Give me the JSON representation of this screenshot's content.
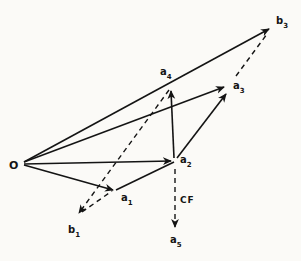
{
  "figure": {
    "background": "#fbfaf7",
    "stroke_color": "#141414",
    "label_color": "#141414",
    "label_font_size": 10,
    "subscript_font_size": 7,
    "nodes": [
      {
        "id": "O",
        "label": "O",
        "sub": "",
        "label_x": 9,
        "label_y": 169,
        "font": 11
      },
      {
        "id": "a1",
        "label": "a",
        "sub": "1",
        "label_x": 121,
        "label_y": 201
      },
      {
        "id": "a2",
        "label": "a",
        "sub": "2",
        "label_x": 180,
        "label_y": 163
      },
      {
        "id": "a3",
        "label": "a",
        "sub": "3",
        "label_x": 233,
        "label_y": 89
      },
      {
        "id": "a4",
        "label": "a",
        "sub": "4",
        "label_x": 160,
        "label_y": 75
      },
      {
        "id": "a5",
        "label": "a",
        "sub": "5",
        "label_x": 170,
        "label_y": 243
      },
      {
        "id": "b1",
        "label": "b",
        "sub": "1",
        "label_x": 68,
        "label_y": 233
      },
      {
        "id": "b3",
        "label": "b",
        "sub": "3",
        "label_x": 276,
        "label_y": 24
      }
    ],
    "edges": [
      {
        "id": "O-a1",
        "x1": 24,
        "y1": 165,
        "x2": 113,
        "y2": 190,
        "style": "solid",
        "arrow": true
      },
      {
        "id": "O-a2",
        "x1": 24,
        "y1": 164,
        "x2": 171,
        "y2": 161,
        "style": "solid",
        "arrow": true
      },
      {
        "id": "O-a3",
        "x1": 24,
        "y1": 162,
        "x2": 224,
        "y2": 87,
        "style": "solid",
        "arrow": true
      },
      {
        "id": "O-b3",
        "x1": 24,
        "y1": 162,
        "x2": 269,
        "y2": 29,
        "style": "solid",
        "arrow": true
      },
      {
        "id": "a1-a2",
        "x1": 116,
        "y1": 190,
        "x2": 174,
        "y2": 162,
        "style": "solid",
        "arrow": false
      },
      {
        "id": "a2-a4",
        "x1": 174,
        "y1": 158,
        "x2": 171,
        "y2": 91,
        "style": "solid",
        "arrow": true
      },
      {
        "id": "a2-a3",
        "x1": 177,
        "y1": 158,
        "x2": 226,
        "y2": 94,
        "style": "solid",
        "arrow": true
      },
      {
        "id": "a4-b1",
        "x1": 169,
        "y1": 90,
        "x2": 79,
        "y2": 213,
        "style": "dashed",
        "arrow": true
      },
      {
        "id": "b1-a1",
        "x1": 82,
        "y1": 212,
        "x2": 112,
        "y2": 191,
        "style": "dashed",
        "arrow": false
      },
      {
        "id": "a3-b3",
        "x1": 236,
        "y1": 76,
        "x2": 267,
        "y2": 34,
        "style": "dashed",
        "arrow": false
      },
      {
        "id": "a2-a5",
        "x1": 175,
        "y1": 169,
        "x2": 175,
        "y2": 227,
        "style": "dashed",
        "arrow": true
      }
    ],
    "annotations": [
      {
        "id": "cf-label",
        "text": "CF",
        "x": 180,
        "y": 203
      }
    ]
  }
}
